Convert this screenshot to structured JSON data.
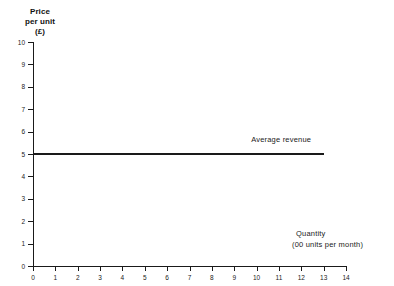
{
  "chart_data": {
    "type": "line",
    "title": "",
    "ylabel": "Price per unit (£)",
    "ylabel_lines": [
      "Price",
      "per unit",
      "(£)"
    ],
    "xlabel": "Quantity (00 units per month)",
    "xlabel_lines": [
      "Quantity",
      "(00 units per month)"
    ],
    "xlim": [
      0,
      14
    ],
    "ylim": [
      0,
      10
    ],
    "x_ticks": [
      0,
      1,
      2,
      3,
      4,
      5,
      6,
      7,
      8,
      9,
      10,
      11,
      12,
      13,
      14
    ],
    "y_ticks": [
      0,
      1,
      2,
      3,
      4,
      5,
      6,
      7,
      8,
      9,
      10
    ],
    "grid": false,
    "legend_position": "inline-annotation",
    "series": [
      {
        "name": "Average revenue",
        "annotation": "Average revenue",
        "x": [
          0,
          13
        ],
        "values": [
          5,
          5
        ],
        "color": "#1a1a1a"
      }
    ],
    "annotations": [
      {
        "text": "Average revenue",
        "x": 11.1,
        "y": 5.45
      }
    ]
  },
  "style": {
    "line_color": "#1a1a1a",
    "axis_color": "#1a1a1a",
    "background": "#ffffff"
  }
}
